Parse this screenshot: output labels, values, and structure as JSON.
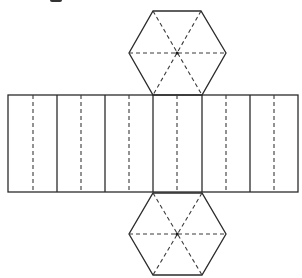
{
  "diagram": {
    "type": "net",
    "colors": {
      "line": "#2b2b2b",
      "background": "#ffffff"
    },
    "rectangle": {
      "x": 8,
      "y": 95,
      "width": 290,
      "height": 97,
      "solid_dividers_x": [
        57,
        105,
        153,
        202,
        250
      ],
      "dashed_dividers_x": [
        33,
        81,
        129,
        177,
        226,
        274
      ],
      "face_count": 6
    },
    "top_hexagon": {
      "center": [
        177,
        53
      ],
      "vertices": [
        [
          153,
          11
        ],
        [
          201,
          11
        ],
        [
          226,
          53
        ],
        [
          202,
          95
        ],
        [
          153,
          95
        ],
        [
          129,
          53
        ]
      ],
      "dashed_diagonals": 3
    },
    "bottom_hexagon": {
      "center": [
        177,
        234
      ],
      "vertices": [
        [
          153,
          193
        ],
        [
          202,
          193
        ],
        [
          226,
          234
        ],
        [
          202,
          275
        ],
        [
          153,
          275
        ],
        [
          129,
          234
        ]
      ],
      "dashed_diagonals": 3
    }
  }
}
